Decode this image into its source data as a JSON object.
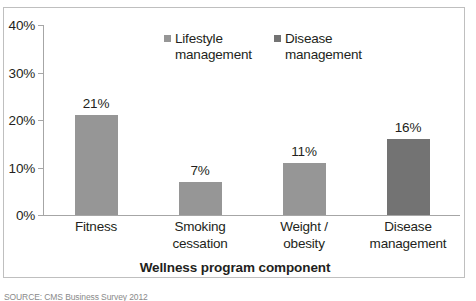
{
  "chart_data": {
    "type": "bar",
    "title": "",
    "categories": [
      "Fitness",
      "Smoking cessation",
      "Weight /\nobesity",
      "Disease\nmanagement"
    ],
    "values": [
      21,
      7,
      11,
      16
    ],
    "value_labels": [
      "21%",
      "7%",
      "11%",
      "16%"
    ],
    "bar_colors": [
      "#969696",
      "#969696",
      "#969696",
      "#737373"
    ],
    "xlabel": "Wellness program component",
    "ylabel": "",
    "ylim": [
      0,
      40
    ],
    "ytick_labels": [
      "0%",
      "10%",
      "20%",
      "30%",
      "40%"
    ],
    "ytick_values": [
      0,
      10,
      20,
      30,
      40
    ],
    "grid": false,
    "legend_position": "top-center",
    "legend": [
      {
        "label": "Lifestyle\nmanagement",
        "color": "#969696"
      },
      {
        "label": "Disease\nmanagement",
        "color": "#737373"
      }
    ]
  },
  "footer": {
    "source_note": "SOURCE: CMS Business Survey 2012"
  },
  "colors": {
    "light_bar": "#969696",
    "dark_bar": "#737373",
    "axis": "#a6a6a6",
    "frame": "#bfbfbf",
    "text": "#231f20"
  }
}
